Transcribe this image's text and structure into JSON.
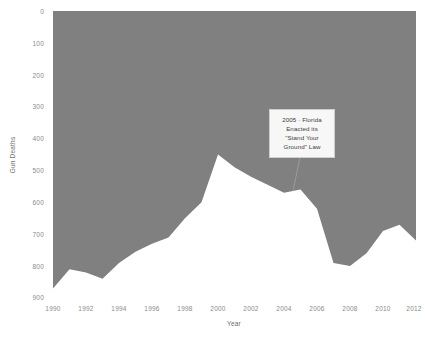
{
  "chart_data": {
    "type": "area",
    "title": "",
    "xlabel": "Year",
    "ylabel": "Gun Deaths",
    "x": [
      1990,
      1991,
      1992,
      1993,
      1994,
      1995,
      1996,
      1997,
      1998,
      1999,
      2000,
      2001,
      2002,
      2003,
      2004,
      2005,
      2006,
      2007,
      2008,
      2009,
      2010,
      2011,
      2012
    ],
    "values": [
      870,
      810,
      820,
      840,
      790,
      755,
      730,
      710,
      650,
      600,
      450,
      490,
      520,
      545,
      570,
      560,
      620,
      790,
      800,
      760,
      690,
      670,
      720
    ],
    "series": [
      {
        "name": "Gun Deaths",
        "values": [
          870,
          810,
          820,
          840,
          790,
          755,
          730,
          710,
          650,
          600,
          450,
          490,
          520,
          545,
          570,
          560,
          620,
          790,
          800,
          760,
          690,
          670,
          720
        ]
      }
    ],
    "xlim": [
      1990,
      2012
    ],
    "ylim": [
      0,
      900
    ],
    "y_inverted": true,
    "grid": false,
    "legend": "none",
    "fill_color": "#808080",
    "background_color": "#ffffff",
    "xticks": [
      1990,
      1992,
      1994,
      1996,
      1998,
      2000,
      2002,
      2004,
      2006,
      2008,
      2010,
      2012
    ],
    "xtick_labels": [
      "1990",
      "1992",
      "1994",
      "1996",
      "1998",
      "2000",
      "2002",
      "2004",
      "2006",
      "2008",
      "2010",
      "2012"
    ],
    "yticks": [
      0,
      100,
      200,
      300,
      400,
      500,
      600,
      700,
      800,
      900
    ],
    "ytick_labels": [
      "0",
      "100",
      "200",
      "300",
      "400",
      "500",
      "600",
      "700",
      "800",
      "900"
    ],
    "annotations": [
      {
        "name": "stand-your-ground-annotation",
        "lines": [
          "2005 · Florida",
          "Enacted its",
          "\"Stand Your",
          "Ground\" Law"
        ],
        "target_x": 2005,
        "target_y": 560
      }
    ]
  }
}
